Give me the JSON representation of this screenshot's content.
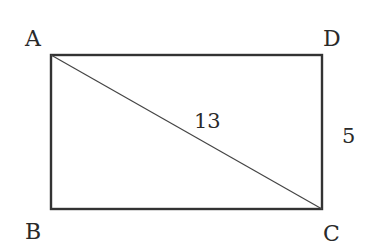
{
  "diagram": {
    "type": "geometry-rectangle",
    "vertices": {
      "A": {
        "label": "A"
      },
      "B": {
        "label": "B"
      },
      "C": {
        "label": "C"
      },
      "D": {
        "label": "D"
      }
    },
    "measurements": {
      "diagonal_AC": "13",
      "side_DC": "5"
    },
    "colors": {
      "stroke": "#333333",
      "text": "#2a2a2a",
      "background": "#ffffff"
    }
  }
}
